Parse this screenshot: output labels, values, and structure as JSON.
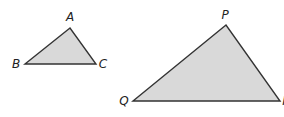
{
  "diagram": {
    "type": "similar-triangles",
    "fill_color": "#d9d9d9",
    "stroke_color": "#333333",
    "triangles": [
      {
        "name": "ABC",
        "vertices": [
          {
            "label": "A",
            "x": 70,
            "y": 28,
            "label_x": 70,
            "label_y": 21
          },
          {
            "label": "B",
            "x": 25,
            "y": 64,
            "label_x": 16,
            "label_y": 68
          },
          {
            "label": "C",
            "x": 96,
            "y": 64,
            "label_x": 103,
            "label_y": 68
          }
        ]
      },
      {
        "name": "PQR",
        "vertices": [
          {
            "label": "P",
            "x": 226,
            "y": 25,
            "label_x": 225,
            "label_y": 19
          },
          {
            "label": "Q",
            "x": 133,
            "y": 101,
            "label_x": 124,
            "label_y": 105
          },
          {
            "label": "I",
            "x": 280,
            "y": 101,
            "label_x": 284,
            "label_y": 105
          }
        ]
      }
    ]
  }
}
